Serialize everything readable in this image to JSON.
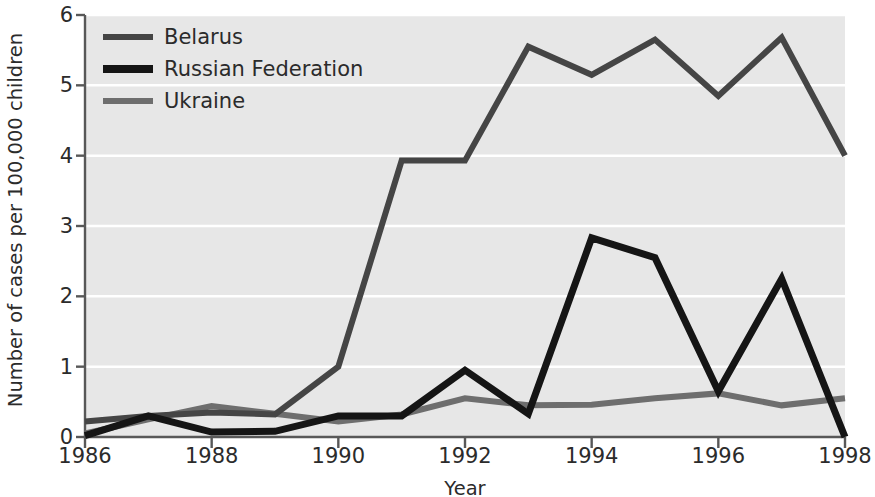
{
  "chart_data": {
    "type": "line",
    "title": "",
    "xlabel": "Year",
    "ylabel": "Number of cases per 100,000 children",
    "x": [
      1986,
      1987,
      1988,
      1989,
      1990,
      1991,
      1992,
      1993,
      1994,
      1995,
      1996,
      1997,
      1998
    ],
    "xlim": [
      1986,
      1998
    ],
    "ylim": [
      0,
      6
    ],
    "xticks": [
      1986,
      1988,
      1990,
      1992,
      1994,
      1996,
      1998
    ],
    "xtick_labels": [
      "1986",
      "1988",
      "1990",
      "1992",
      "1994",
      "1996",
      "1998"
    ],
    "yticks": [
      0,
      1,
      2,
      3,
      4,
      5,
      6
    ],
    "ytick_labels": [
      "0",
      "1",
      "2",
      "3",
      "4",
      "5",
      "6"
    ],
    "grid": "horizontal-white",
    "plot_background": "#e7e7e7",
    "legend_position": "top-left",
    "series": [
      {
        "name": "Belarus",
        "color": "#454545",
        "width": 6,
        "values": [
          0.22,
          0.3,
          0.35,
          0.32,
          1.0,
          3.93,
          3.93,
          5.55,
          5.15,
          5.65,
          4.85,
          5.68,
          4.0
        ]
      },
      {
        "name": "Russian Federation",
        "color": "#151515",
        "width": 7,
        "values": [
          0.02,
          0.3,
          0.07,
          0.08,
          0.3,
          0.3,
          0.95,
          0.33,
          2.83,
          2.55,
          0.65,
          2.25,
          0.0
        ]
      },
      {
        "name": "Ukraine",
        "color": "#6e6e6e",
        "width": 6,
        "values": [
          0.05,
          0.25,
          0.44,
          0.33,
          0.22,
          0.32,
          0.55,
          0.45,
          0.46,
          0.55,
          0.62,
          0.45,
          0.55
        ]
      }
    ]
  },
  "axes": {
    "ytick_labels": [
      "0",
      "1",
      "2",
      "3",
      "4",
      "5",
      "6"
    ],
    "xtick_labels": [
      "1986",
      "1988",
      "1990",
      "1992",
      "1994",
      "1996",
      "1998"
    ],
    "ylabel": "Number of cases per 100,000 children",
    "xlabel": "Year"
  },
  "legend": {
    "items": [
      {
        "label": "Belarus",
        "color": "#454545"
      },
      {
        "label": "Russian Federation",
        "color": "#151515"
      },
      {
        "label": "Ukraine",
        "color": "#6e6e6e"
      }
    ]
  }
}
